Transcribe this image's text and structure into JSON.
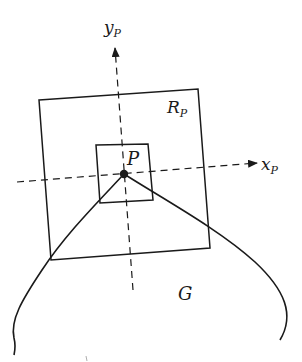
{
  "diagram": {
    "type": "geometric-figure",
    "colors": {
      "stroke": "#1a1a1a",
      "background": "#ffffff"
    },
    "labels": {
      "y_axis": {
        "main": "y",
        "sub": "P"
      },
      "x_axis": {
        "main": "x",
        "sub": "P"
      },
      "outer_rect": {
        "main": "R",
        "sub": "P"
      },
      "point": "P",
      "region": "G"
    },
    "elements": [
      {
        "id": "outer-rectangle",
        "label": "R_P"
      },
      {
        "id": "inner-rectangle",
        "label": ""
      },
      {
        "id": "point",
        "label": "P"
      },
      {
        "id": "x-axis",
        "label": "x_P",
        "style": "dashed-arrow"
      },
      {
        "id": "y-axis",
        "label": "y_P",
        "style": "dashed-arrow"
      },
      {
        "id": "boundary-curve",
        "label": "G"
      }
    ]
  }
}
